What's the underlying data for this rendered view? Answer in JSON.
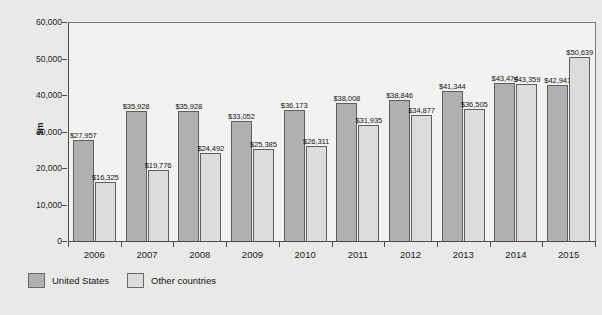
{
  "chart_data": {
    "type": "bar",
    "title": "",
    "xlabel": "",
    "ylabel": "$m",
    "ylim": [
      0,
      60000
    ],
    "ytick_labels": [
      "60,000",
      "50,000",
      "40,000",
      "30,000",
      "20,000",
      "10,000",
      "0"
    ],
    "ytick_values": [
      60000,
      50000,
      40000,
      30000,
      20000,
      10000,
      0
    ],
    "grid": false,
    "legend_position": "bottom-left",
    "categories": [
      "2006",
      "2007",
      "2008",
      "2009",
      "2010",
      "2011",
      "2012",
      "2013",
      "2014",
      "2015"
    ],
    "series": [
      {
        "name": "United States",
        "color": "#b0b0ae",
        "values": [
          27957,
          35928,
          35928,
          33052,
          36173,
          38008,
          38846,
          41344,
          43474,
          42941
        ],
        "labels": [
          "$27,957",
          "$35,928",
          "$35,928",
          "$33,052",
          "$36,173",
          "$38,008",
          "$38,846",
          "$41,344",
          "$43,474",
          "$42,941"
        ]
      },
      {
        "name": "Other countries",
        "color": "#dcdcda",
        "values": [
          16325,
          19776,
          24492,
          25385,
          26311,
          31935,
          34877,
          36505,
          43359,
          50639
        ],
        "labels": [
          "$16,325",
          "$19,776",
          "$24,492",
          "$25,385",
          "$26,311",
          "$31,935",
          "$34,877",
          "$36,505",
          "$43,359",
          "$50,639"
        ]
      }
    ]
  },
  "legend": {
    "items": [
      {
        "label": "United States"
      },
      {
        "label": "Other countries"
      }
    ]
  }
}
